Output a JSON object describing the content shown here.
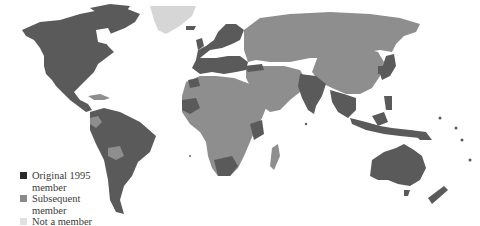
{
  "map": {
    "colors": {
      "original": "#5a5a5a",
      "subsequent": "#8e8e8e",
      "non_member": "#d6d6d6",
      "ocean": "#ffffff"
    }
  },
  "legend": {
    "items": [
      {
        "key": "original",
        "label": "Original 1995 member",
        "color": "#2a2a2a"
      },
      {
        "key": "subsequent",
        "label": "Subsequent member",
        "color": "#8a8a8a"
      },
      {
        "key": "non_member",
        "label": "Not a member",
        "color": "#e0e0e0"
      }
    ]
  }
}
